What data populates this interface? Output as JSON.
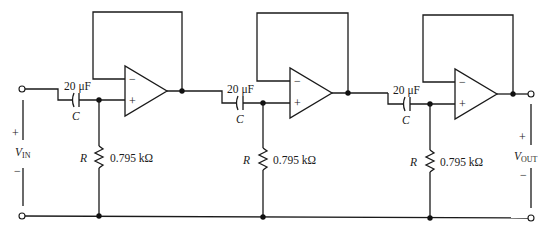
{
  "diagram": {
    "input": {
      "label_main": "V",
      "label_sub": "IN",
      "plus": "+",
      "minus": "−"
    },
    "output": {
      "label_main": "V",
      "label_sub": "OUT",
      "plus": "+",
      "minus": "−"
    },
    "stages": [
      {
        "capacitor_value": "20 μF",
        "capacitor_symbol": "C",
        "resistor_value": "0.795 kΩ",
        "resistor_symbol": "R",
        "opamp_minus": "−",
        "opamp_plus": "+"
      },
      {
        "capacitor_value": "20 μF",
        "capacitor_symbol": "C",
        "resistor_value": "0.795 kΩ",
        "resistor_symbol": "R",
        "opamp_minus": "−",
        "opamp_plus": "+"
      },
      {
        "capacitor_value": "20 μF",
        "capacitor_symbol": "C",
        "resistor_value": "0.795 kΩ",
        "resistor_symbol": "R",
        "opamp_minus": "−",
        "opamp_plus": "+"
      }
    ]
  }
}
